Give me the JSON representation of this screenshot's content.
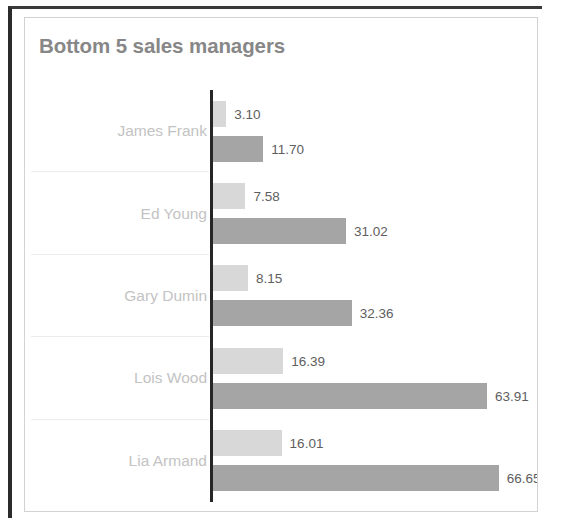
{
  "chart_data": {
    "type": "bar",
    "orientation": "horizontal",
    "title": "Bottom 5 sales managers",
    "xlabel": "",
    "ylabel": "",
    "grid": true,
    "legend": "none",
    "axis_visible": true,
    "categories": [
      "James Frank",
      "Ed Young",
      "Gary Dumin",
      "Lois Wood",
      "Lia Armand"
    ],
    "series": [
      {
        "name": "series-1",
        "color": "#d8d8d8",
        "values": [
          3.1,
          7.58,
          8.15,
          16.39,
          16.01
        ]
      },
      {
        "name": "series-2",
        "color": "#a5a5a5",
        "values": [
          11.7,
          31.02,
          32.36,
          63.91,
          66.65
        ]
      }
    ],
    "value_labels": [
      [
        "3.10",
        "11.70"
      ],
      [
        "7.58",
        "31.02"
      ],
      [
        "8.15",
        "32.36"
      ],
      [
        "16.39",
        "63.91"
      ],
      [
        "16.01",
        "66.65"
      ]
    ],
    "xlim": [
      0,
      70
    ]
  },
  "colors": {
    "title": "#878787",
    "category_label": "#c3c3c3",
    "value_label": "#5e5e5e",
    "axis": "#262626",
    "gridline": "#ededed",
    "series_light": "#d8d8d8",
    "series_dark": "#a5a5a5"
  }
}
